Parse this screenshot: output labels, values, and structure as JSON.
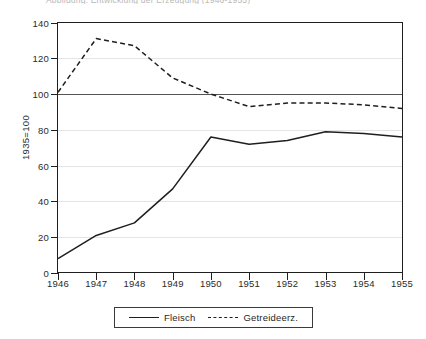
{
  "caption": {
    "text": "Abbildung: Entwicklung der Erzeugung (1946-1955)"
  },
  "chart_data": {
    "type": "line",
    "title": "",
    "subtitle": "",
    "xlabel": "",
    "ylabel": "1935=100",
    "x": [
      1946,
      1947,
      1948,
      1949,
      1950,
      1951,
      1952,
      1953,
      1954,
      1955
    ],
    "xticklabels": [
      "1946",
      "1947",
      "1948",
      "1949",
      "1950",
      "1951",
      "1952",
      "1953",
      "1954",
      "1955"
    ],
    "xlim": [
      1946,
      1955
    ],
    "ylim": [
      0,
      140
    ],
    "yticks": [
      0,
      20,
      40,
      60,
      80,
      100,
      120,
      140
    ],
    "yticklabels": [
      "0",
      "20",
      "40",
      "60",
      "80",
      "100",
      "120",
      "140"
    ],
    "grid": true,
    "reference_line": 100,
    "legend_position": "bottom-center",
    "series": [
      {
        "name": "Fleisch",
        "style": "solid",
        "color": "#1f1f1f",
        "values": [
          8,
          21,
          28,
          47,
          76,
          72,
          74,
          79,
          78,
          76
        ]
      },
      {
        "name": "Getreideerz.",
        "style": "dashed",
        "color": "#1f1f1f",
        "values": [
          101,
          131,
          127,
          109,
          100,
          93,
          95,
          95,
          94,
          92
        ]
      }
    ]
  },
  "legend": {
    "items": [
      {
        "label": "Fleisch",
        "style": "solid"
      },
      {
        "label": "Getreideerz.",
        "style": "dashed"
      }
    ]
  }
}
